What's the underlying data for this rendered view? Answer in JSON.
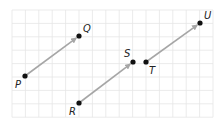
{
  "diagram": {
    "type": "vector-translation-grid",
    "grid": {
      "x0": 12,
      "y0": 10,
      "cols": 15,
      "rows": 8,
      "cell": 13.4,
      "line_color": "#e6e6e6"
    },
    "colors": {
      "vector": "#a6a6a6",
      "point": "#111111",
      "label": "#222222"
    },
    "points": [
      {
        "name": "P",
        "x": 25,
        "y": 76,
        "label_x": 15,
        "label_y": 80
      },
      {
        "name": "Q",
        "x": 79,
        "y": 36,
        "label_x": 83,
        "label_y": 24
      },
      {
        "name": "R",
        "x": 79,
        "y": 103,
        "label_x": 69,
        "label_y": 107
      },
      {
        "name": "S",
        "x": 133,
        "y": 62,
        "label_x": 124,
        "label_y": 49
      },
      {
        "name": "T",
        "x": 146,
        "y": 62,
        "label_x": 149,
        "label_y": 66
      },
      {
        "name": "U",
        "x": 200,
        "y": 23,
        "label_x": 204,
        "label_y": 11
      }
    ],
    "vectors": [
      {
        "from": "P",
        "to": "Q",
        "label": "PQ"
      },
      {
        "from": "R",
        "to": "S",
        "label": "RS"
      },
      {
        "from": "T",
        "to": "U",
        "label": "TU"
      }
    ]
  }
}
